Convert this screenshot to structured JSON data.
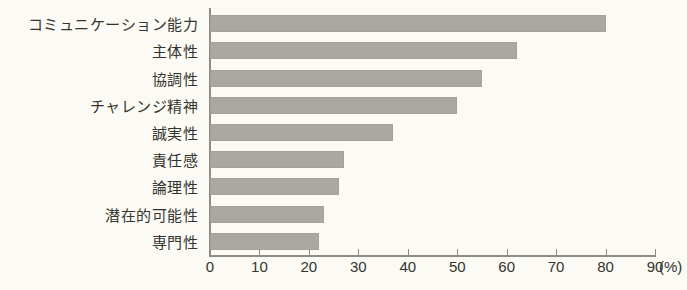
{
  "chart_data": {
    "type": "bar",
    "orientation": "horizontal",
    "title": "",
    "xlabel": "(%)",
    "ylabel": "",
    "xlim": [
      0,
      90
    ],
    "xticks": [
      0,
      10,
      20,
      30,
      40,
      50,
      60,
      70,
      80,
      90
    ],
    "xtick_labels": [
      "0",
      "10",
      "20",
      "30",
      "40",
      "50",
      "60",
      "70",
      "80",
      "90"
    ],
    "unit_label": "(%)",
    "grid": false,
    "legend": null,
    "bar_color": "#a9a9a2",
    "axis_color": "#8e8d85",
    "background_color": "#fbfaf5",
    "categories": [
      "コミュニケーション能力",
      "主体性",
      "協調性",
      "チャレンジ精神",
      "誠実性",
      "責任感",
      "論理性",
      "潜在的可能性",
      "専門性"
    ],
    "values": [
      80,
      62,
      55,
      50,
      37,
      27,
      26,
      23,
      22
    ]
  }
}
